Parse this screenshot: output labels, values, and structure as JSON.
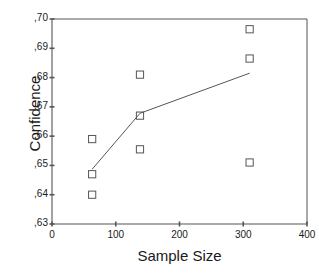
{
  "chart_data": {
    "type": "scatter",
    "title": "",
    "subtitle": "",
    "xlabel": "Sample Size",
    "ylabel": "Confidence",
    "xlim": [
      0,
      400
    ],
    "ylim": [
      0.63,
      0.7
    ],
    "grid": false,
    "legend": false,
    "legend_position": "none",
    "xticks": [
      0,
      100,
      200,
      300,
      400
    ],
    "xtick_labels": [
      "0",
      "100",
      "200",
      "300",
      "400"
    ],
    "yticks": [
      0.63,
      0.64,
      0.65,
      0.66,
      0.67,
      0.68,
      0.69,
      0.7
    ],
    "ytick_labels": [
      ",63",
      ",64",
      ",65",
      ",66",
      ",67",
      ",68",
      ",69",
      ",70"
    ],
    "marker": "open-square",
    "marker_color": "#555555",
    "line_color": "#555555",
    "axis_color": "#555555",
    "series": [
      {
        "name": "Observations",
        "type": "scatter",
        "points": [
          {
            "x": 63,
            "y": 0.659
          },
          {
            "x": 63,
            "y": 0.647
          },
          {
            "x": 63,
            "y": 0.64
          },
          {
            "x": 138,
            "y": 0.681
          },
          {
            "x": 138,
            "y": 0.667
          },
          {
            "x": 138,
            "y": 0.6555
          },
          {
            "x": 310,
            "y": 0.6965
          },
          {
            "x": 310,
            "y": 0.6865
          },
          {
            "x": 310,
            "y": 0.651
          }
        ]
      },
      {
        "name": "Mean trend",
        "type": "line",
        "points": [
          {
            "x": 63,
            "y": 0.6487
          },
          {
            "x": 138,
            "y": 0.6678
          },
          {
            "x": 310,
            "y": 0.6815
          }
        ]
      }
    ]
  }
}
